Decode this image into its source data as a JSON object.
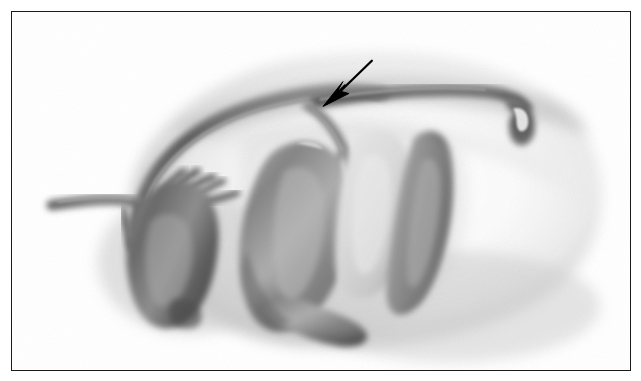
{
  "figure": {
    "domain": "medical-illustration",
    "title": "Grayscale anatomical airbrush illustration of retroperitoneal abdominal organs and vasculature",
    "caption": "",
    "style": "monochrome airbrush / stipple medical art",
    "background_color": "#ffffff",
    "frame": {
      "border_color": "#1b1b1b",
      "border_width_px": 1.3,
      "x": 11,
      "y": 11,
      "width": 620,
      "height": 360
    },
    "palette": {
      "paper_white": "#ffffff",
      "soft_body_gray": "#d9d9d9",
      "mid_gray": "#9b9b9b",
      "organ_shadow_gray": "#6e6e6e",
      "deep_shadow_gray": "#4a4a4a",
      "vessel_dark_gray": "#585858",
      "highlight_white": "#fafafa",
      "annotation_black": "#000000"
    },
    "annotations": [
      {
        "name": "pointer-arrow",
        "type": "arrow",
        "color": "#000000",
        "tail_x": 372,
        "tail_y": 60,
        "tip_x": 329,
        "tip_y": 99,
        "shaft_width_px": 2,
        "head_length_px": 18,
        "description": "solid black arrow pointing down-left to a vessel branch junction"
      }
    ],
    "structures": [
      {
        "name": "body-mass-silhouette",
        "label": "Soft-tissue body mass (retroperitoneal bed)",
        "shade": "#dcdcdc",
        "description": "Large soft-edged oval mass filling the frame, lighter at centre-right, shaded at margins"
      },
      {
        "name": "left-organ",
        "label": "Left kidney / adrenal complex",
        "shade": "#777777",
        "description": "Rounded bean-shaped dark organ on the left with arterial branches at its hilum"
      },
      {
        "name": "central-organ",
        "label": "Central kidney-shaped organ",
        "shade": "#6b6b6b",
        "description": "Large kidney-shaped dark organ occupying the centre of the field"
      },
      {
        "name": "pale-organ",
        "label": "Pale rounded organ (gallbladder / duodenal bulb)",
        "shade": "#c9c9c9",
        "description": "Light-toned rounded organ lying just right of the central organ"
      },
      {
        "name": "elongated-organ",
        "label": "Elongated curved organ (duodenum / ureteric loop)",
        "shade": "#8a8a8a",
        "description": "Long crescent-shaped structure descending on the right of the pale organ"
      },
      {
        "name": "upper-arch-vessel",
        "label": "Upper arching vessel",
        "shade": "#6a6a6a",
        "description": "Long vessel arching from lower-left upward and across to the right margin"
      },
      {
        "name": "horizontal-vessel",
        "label": "Transected horizontal vessel",
        "shade": "#5e5e5e",
        "description": "Horizontal vessel running to the right, ending in a cut, notched stump"
      },
      {
        "name": "branch-vessels",
        "label": "Arterial branches at organ hilum",
        "shade": "#5a5a5a",
        "description": "Several short finger-like arterial branches arising near the left organ"
      },
      {
        "name": "left-stump-vessel",
        "label": "Left vessel stump",
        "shade": "#6d6d6d",
        "description": "Short vessel entering from the left margin toward the left organ"
      },
      {
        "name": "descending-vessel",
        "label": "Descending branch toward arrow target",
        "shade": "#5c5c5c",
        "description": "Vessel descending from the arch, the junction indicated by the arrow"
      }
    ]
  }
}
